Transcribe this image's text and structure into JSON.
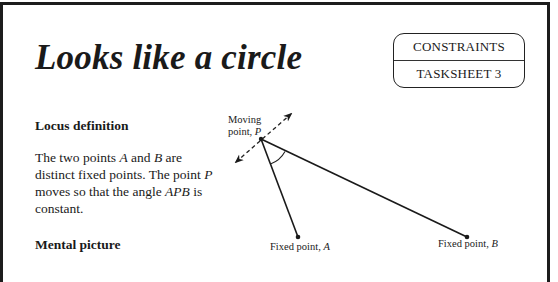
{
  "page": {
    "title": "Looks like a circle",
    "badge": {
      "top": "CONSTRAINTS",
      "bottom": "TASKSHEET 3"
    }
  },
  "sections": {
    "locus": {
      "heading": "Locus definition",
      "text_parts": {
        "p1": "The two points ",
        "A": "A",
        "p2": " and ",
        "B": "B",
        "p3": " are distinct fixed points.  The point ",
        "P": "P",
        "p4": " moves so that the angle ",
        "APB": "APB",
        "p5": " is constant."
      }
    },
    "mental": {
      "heading": "Mental picture"
    }
  },
  "diagram": {
    "labels": {
      "moving_line1": "Moving",
      "moving_line2": "point, ",
      "moving_var": "P",
      "fixed_a": "Fixed point, ",
      "fixed_a_var": "A",
      "fixed_b": "Fixed point, ",
      "fixed_b_var": "B"
    },
    "points": {
      "P": [
        261,
        139
      ],
      "A": [
        298,
        237
      ],
      "B": [
        467,
        237
      ]
    }
  }
}
